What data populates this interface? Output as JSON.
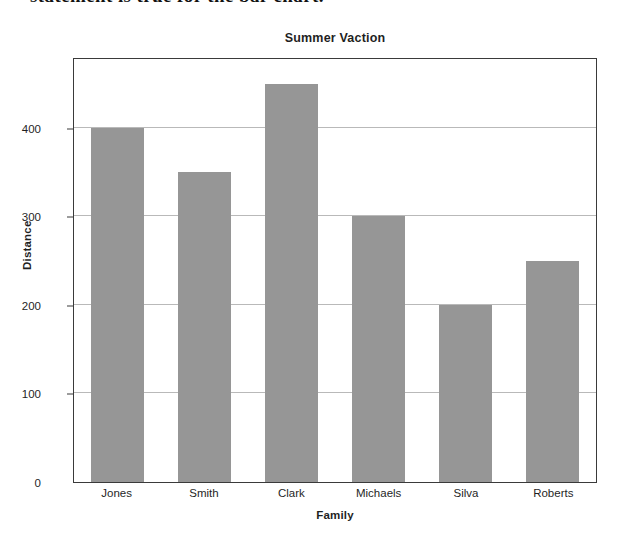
{
  "page": {
    "cutoff_header_text": "statement is true for the bar chart."
  },
  "chart_data": {
    "type": "bar",
    "title": "Summer Vaction",
    "xlabel": "Family",
    "ylabel": "Distance",
    "categories": [
      "Jones",
      "Smith",
      "Clark",
      "Michaels",
      "Silva",
      "Roberts"
    ],
    "values": [
      400,
      350,
      450,
      300,
      200,
      250
    ],
    "ylim": [
      0,
      480
    ],
    "yticks": [
      0,
      100,
      200,
      300,
      400
    ],
    "ytick_labels": [
      "0",
      "100",
      "200",
      "300",
      "400"
    ],
    "grid": true,
    "legend": false,
    "bar_color": "#969696",
    "grid_color": "#b9b9b9",
    "frame_color": "#3a3a3a",
    "text_color": "#1f1f1f"
  }
}
